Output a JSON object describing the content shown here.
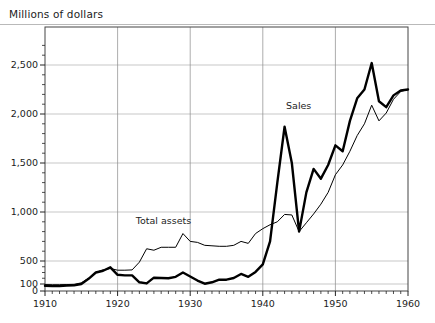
{
  "header": {
    "title": "Millions of dollars"
  },
  "chart_data": {
    "type": "line",
    "title": "Millions of dollars",
    "xlabel": "",
    "ylabel": "Millions of dollars",
    "grid": true,
    "legend_position": "inline-annotation",
    "xlim": [
      1910,
      1960
    ],
    "ylim": [
      0,
      2750
    ],
    "xticks": [
      1910,
      1920,
      1930,
      1940,
      1950,
      1960
    ],
    "xtick_labels": [
      "1910",
      "1920",
      "1930",
      "1940",
      "1950",
      "1960"
    ],
    "xtick_minor_step": 1,
    "yticks": [
      0,
      100,
      500,
      1000,
      1500,
      2000,
      2500
    ],
    "ytick_labels": [
      "0",
      "100",
      "500",
      "1,000",
      "1,500",
      "2,000",
      "2,500"
    ],
    "y_axis_note": "non-linear: 0 and 100 compressed at base, then linear 500-2500",
    "x": [
      1910,
      1911,
      1912,
      1913,
      1914,
      1915,
      1916,
      1917,
      1918,
      1919,
      1920,
      1921,
      1922,
      1923,
      1924,
      1925,
      1926,
      1927,
      1928,
      1929,
      1930,
      1931,
      1932,
      1933,
      1934,
      1935,
      1936,
      1937,
      1938,
      1939,
      1940,
      1941,
      1942,
      1943,
      1944,
      1945,
      1946,
      1947,
      1948,
      1949,
      1950,
      1951,
      1952,
      1953,
      1954,
      1955,
      1956,
      1957,
      1958,
      1959,
      1960
    ],
    "series": [
      {
        "name": "Sales",
        "style": "bold",
        "label": "Sales",
        "values": [
          75,
          70,
          72,
          78,
          80,
          100,
          190,
          300,
          330,
          390,
          260,
          250,
          250,
          130,
          110,
          210,
          205,
          200,
          225,
          300,
          230,
          160,
          105,
          130,
          175,
          175,
          205,
          275,
          225,
          310,
          440,
          700,
          1300,
          1870,
          1500,
          800,
          1200,
          1440,
          1340,
          1480,
          1680,
          1620,
          1930,
          2160,
          2250,
          2520,
          2130,
          2070,
          2190,
          2240,
          2250
        ]
      },
      {
        "name": "Total assets",
        "style": "thin",
        "label": "Total assets",
        "values": [
          92,
          90,
          90,
          92,
          95,
          120,
          200,
          300,
          345,
          370,
          340,
          340,
          345,
          480,
          625,
          610,
          640,
          640,
          640,
          780,
          700,
          690,
          660,
          655,
          650,
          650,
          660,
          700,
          680,
          780,
          830,
          870,
          900,
          975,
          970,
          800,
          890,
          980,
          1080,
          1200,
          1380,
          1480,
          1620,
          1780,
          1900,
          2090,
          1930,
          2010,
          2150,
          2230,
          2250
        ]
      }
    ],
    "annotations": [
      {
        "text": "Sales",
        "x": 1943.2,
        "y": 2050
      },
      {
        "text": "Total assets",
        "x": 1922.5,
        "y": 880
      }
    ]
  }
}
